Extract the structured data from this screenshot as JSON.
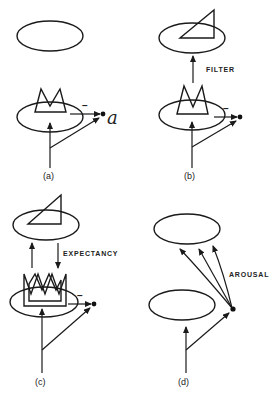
{
  "figure": {
    "panels": [
      {
        "id": "a",
        "label": "(a)",
        "output_label": "a",
        "inhibition_sign": "–"
      },
      {
        "id": "b",
        "label": "(b)",
        "pathway_label": "FILTER",
        "inhibition_sign": "–"
      },
      {
        "id": "c",
        "label": "(c)",
        "pathway_label": "EXPECTANCY",
        "inhibition_sign": "–"
      },
      {
        "id": "d",
        "label": "(d)",
        "pathway_label": "AROUSAL"
      }
    ],
    "colors": {
      "ink": "#1a1a1a",
      "background": "#ffffff"
    }
  }
}
